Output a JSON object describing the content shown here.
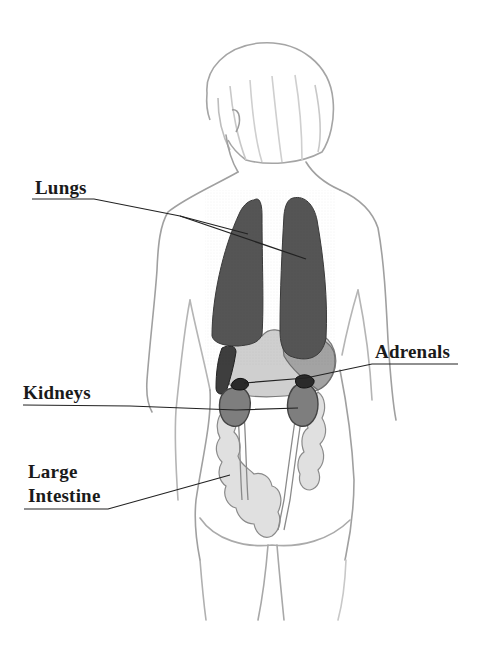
{
  "diagram": {
    "labels": {
      "lungs": "Lungs",
      "adrenals": "Adrenals",
      "kidneys": "Kidneys",
      "large_intestine_line1": "Large",
      "large_intestine_line2": "Intestine"
    },
    "colors": {
      "background": "#ffffff",
      "outline": "#9a9a9a",
      "lungs": "#555555",
      "liver_stomach": "#a8a8a8",
      "light_organ": "#d4d4d4",
      "kidneys": "#7f7f7f",
      "adrenals": "#2a2a2a",
      "intestine": "#dedede",
      "leader_line": "#222222",
      "label_text": "#1a1a1a"
    }
  }
}
